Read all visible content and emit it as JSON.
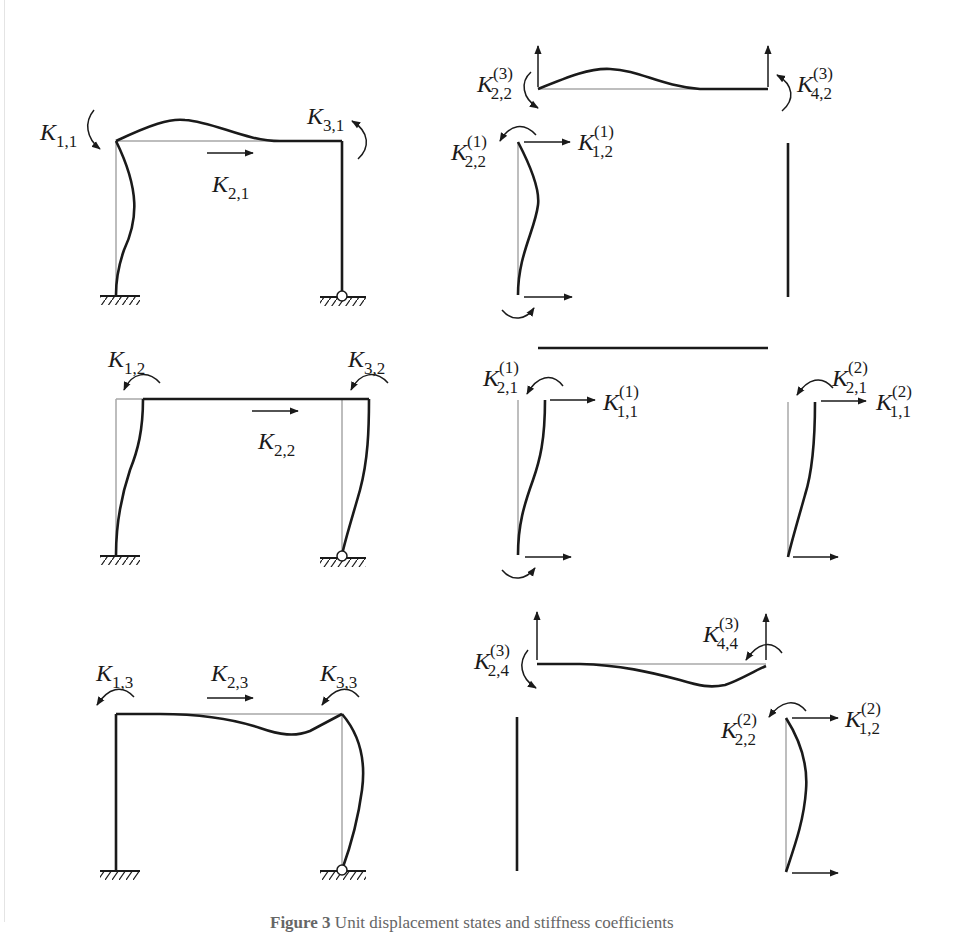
{
  "figure": {
    "caption_prefix": "Figure 3",
    "caption_text": "Unit displacement states and stiffness coefficients"
  },
  "colors": {
    "deformed": "#1a1a1a",
    "undeformed": "#a8a8a8",
    "text": "#1a1a1a"
  },
  "panels": [
    {
      "id": "state-1",
      "frame_labels": [
        {
          "main": "K",
          "sub": "1,1"
        },
        {
          "main": "K",
          "sub": "2,1"
        },
        {
          "main": "K",
          "sub": "3,1"
        }
      ],
      "members": {
        "beam_labels": [
          {
            "main": "K",
            "sub": "2,2",
            "sup": "(3)"
          },
          {
            "main": "K",
            "sub": "4,2",
            "sup": "(3)"
          }
        ],
        "left_column_labels": [
          {
            "main": "K",
            "sub": "2,2",
            "sup": "(1)"
          },
          {
            "main": "K",
            "sub": "1,2",
            "sup": "(1)"
          }
        ]
      }
    },
    {
      "id": "state-2",
      "frame_labels": [
        {
          "main": "K",
          "sub": "1,2"
        },
        {
          "main": "K",
          "sub": "2,2"
        },
        {
          "main": "K",
          "sub": "3,2"
        }
      ],
      "members": {
        "left_column_labels": [
          {
            "main": "K",
            "sub": "2,1",
            "sup": "(1)"
          },
          {
            "main": "K",
            "sub": "1,1",
            "sup": "(1)"
          }
        ],
        "right_column_labels": [
          {
            "main": "K",
            "sub": "2,1",
            "sup": "(2)"
          },
          {
            "main": "K",
            "sub": "1,1",
            "sup": "(2)"
          }
        ]
      }
    },
    {
      "id": "state-3",
      "frame_labels": [
        {
          "main": "K",
          "sub": "1,3"
        },
        {
          "main": "K",
          "sub": "2,3"
        },
        {
          "main": "K",
          "sub": "3,3"
        }
      ],
      "members": {
        "beam_labels": [
          {
            "main": "K",
            "sub": "2,4",
            "sup": "(3)"
          },
          {
            "main": "K",
            "sub": "4,4",
            "sup": "(3)"
          }
        ],
        "right_column_labels": [
          {
            "main": "K",
            "sub": "2,2",
            "sup": "(2)"
          },
          {
            "main": "K",
            "sub": "1,2",
            "sup": "(2)"
          }
        ]
      }
    }
  ]
}
